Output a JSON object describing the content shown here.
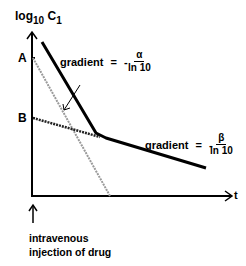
{
  "diagram": {
    "y_axis": {
      "label_main": "log",
      "label_sub1": "10",
      "label_var": "C",
      "label_sub2": "1"
    },
    "x_axis": {
      "label": "t"
    },
    "points": {
      "A": "A",
      "B": "B"
    },
    "alpha_annotation": {
      "prefix": "gradient",
      "equals": "=",
      "minus": "-",
      "numerator": "α",
      "denominator": "ln 10"
    },
    "beta_annotation": {
      "prefix": "gradient",
      "equals": "=",
      "minus": "-",
      "numerator": "β",
      "denominator": "ln 10"
    },
    "injection_label": {
      "line1": "intravenous",
      "line2": "injection of drug"
    },
    "colors": {
      "main_line": "#000000",
      "dashed_line": "#222222",
      "hatched_line": "#9a9a9a"
    }
  }
}
